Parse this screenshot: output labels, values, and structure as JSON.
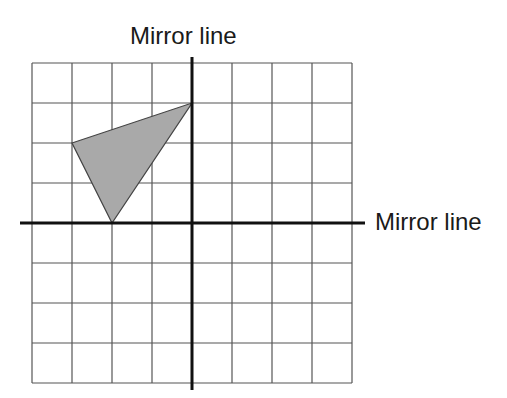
{
  "diagram": {
    "labels": {
      "vertical_mirror": "Mirror line",
      "horizontal_mirror": "Mirror line"
    },
    "grid": {
      "columns": 8,
      "rows": 8,
      "x_range": [
        -4,
        4
      ],
      "y_range": [
        -4,
        4
      ],
      "line_color": "#555555"
    },
    "axes": {
      "color": "#111111",
      "vertical_x": 0,
      "horizontal_y": 0
    },
    "shape": {
      "type": "triangle",
      "vertices": [
        [
          -3,
          2
        ],
        [
          0,
          3
        ],
        [
          -2,
          0
        ]
      ],
      "fill": "#a9a9a9",
      "stroke": "#444444"
    }
  }
}
